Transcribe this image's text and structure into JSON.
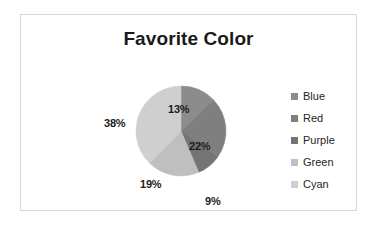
{
  "chart_data": {
    "type": "pie",
    "title": "Favorite Color",
    "categories": [
      "Blue",
      "Red",
      "Purple",
      "Green",
      "Cyan"
    ],
    "values": [
      13,
      22,
      9,
      19,
      38
    ],
    "data_labels": [
      "13%",
      "22%",
      "9%",
      "19%",
      "38%"
    ],
    "slice_colors": [
      "#8c8c8c",
      "#7f7f7f",
      "#747474",
      "#bfbfbf",
      "#cfcfcf"
    ],
    "legend_position": "right",
    "grid": false,
    "xlabel": "",
    "ylabel": "",
    "start_angle_deg": 0,
    "direction": "clockwise"
  },
  "frame": {
    "border_color": "#d6d6d6",
    "background": "#ffffff"
  },
  "title": {
    "text": "Favorite Color",
    "color": "#1a1a1a"
  },
  "pie": {
    "center_x": 160,
    "center_y": 70,
    "radius": 45,
    "slices": [
      {
        "name": "Blue",
        "percent": 13,
        "label": "13%",
        "color": "#8c8c8c",
        "label_x": 147,
        "label_y": 42
      },
      {
        "name": "Red",
        "percent": 22,
        "label": "22%",
        "color": "#7f7f7f",
        "label_x": 168,
        "label_y": 79
      },
      {
        "name": "Purple",
        "percent": 9,
        "label": "9%",
        "color": "#747474",
        "label_x": 184,
        "label_y": 134
      },
      {
        "name": "Green",
        "percent": 19,
        "label": "19%",
        "color": "#bfbfbf",
        "label_x": 119,
        "label_y": 117
      },
      {
        "name": "Cyan",
        "percent": 38,
        "label": "38%",
        "color": "#cfcfcf",
        "label_x": 83,
        "label_y": 56
      }
    ]
  },
  "legend": {
    "items": [
      {
        "label": "Blue",
        "color": "#8c8c8c"
      },
      {
        "label": "Red",
        "color": "#7f7f7f"
      },
      {
        "label": "Purple",
        "color": "#747474"
      },
      {
        "label": "Green",
        "color": "#bfbfbf"
      },
      {
        "label": "Cyan",
        "color": "#cfcfcf"
      }
    ]
  }
}
